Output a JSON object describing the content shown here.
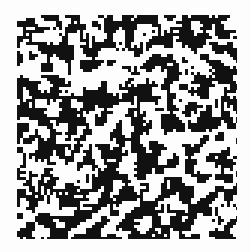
{
  "image": {
    "description": "binary black and white noise pattern",
    "background": "#fdfdfd",
    "ink": "#111111",
    "region": {
      "x": 17,
      "y": 15,
      "width": 220,
      "height": 224
    },
    "cell_size": 3,
    "density": 0.5,
    "seed": 1337
  }
}
